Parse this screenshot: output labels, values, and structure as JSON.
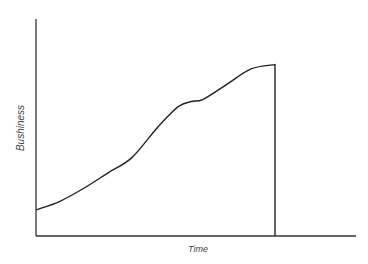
{
  "chart_data": {
    "type": "line",
    "title": "",
    "xlabel": "Time",
    "ylabel": "Bushiness",
    "grid": false,
    "legend": null,
    "x_ticks": [],
    "y_ticks": [],
    "xlim": [
      0,
      1
    ],
    "ylim": [
      0,
      1
    ],
    "series": [
      {
        "name": "bushiness",
        "x": [
          0.0,
          0.1,
          0.2,
          0.3,
          0.4,
          0.5,
          0.55,
          0.6,
          0.65,
          0.7,
          0.8,
          0.9,
          1.0
        ],
        "y": [
          0.12,
          0.16,
          0.22,
          0.29,
          0.36,
          0.49,
          0.55,
          0.6,
          0.62,
          0.63,
          0.7,
          0.77,
          0.79
        ],
        "ends_with_drop_to_zero": true
      }
    ],
    "annotations": [
      "Curve drops vertically to the x-axis at the end of the time span"
    ]
  },
  "labels": {
    "x": "Time",
    "y": "Bushiness"
  }
}
